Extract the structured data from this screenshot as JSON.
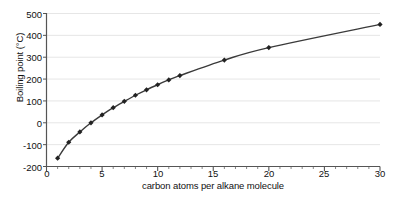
{
  "chart_data": {
    "type": "line",
    "title": "",
    "xlabel": "carbon atoms per alkane molecule",
    "ylabel": "Boiling point (°C)",
    "xlim": [
      0,
      30
    ],
    "ylim": [
      -200,
      500
    ],
    "xticks": [
      0,
      5,
      10,
      15,
      20,
      25,
      30
    ],
    "xtick_labels": [
      "0",
      "5",
      "10",
      "15",
      "20",
      "25",
      "30"
    ],
    "x_minor_tick_step": 1,
    "yticks": [
      -200,
      -100,
      0,
      100,
      200,
      300,
      400,
      500
    ],
    "ytick_labels": [
      "-200",
      "-100",
      "0",
      "100",
      "200",
      "300",
      "400",
      "500"
    ],
    "grid": "horizontal",
    "grid_color": "#e6e6e6",
    "legend": "none",
    "line_color": "#3a3a3a",
    "marker": "diamond",
    "marker_color": "#222222",
    "x": [
      1,
      2,
      3,
      4,
      5,
      6,
      7,
      8,
      9,
      10,
      11,
      12,
      16,
      20,
      30
    ],
    "values": [
      -162,
      -89,
      -42,
      0,
      36,
      69,
      98,
      126,
      151,
      174,
      196,
      216,
      287,
      344,
      450
    ],
    "series": [
      {
        "name": "boiling point",
        "x": [
          1,
          2,
          3,
          4,
          5,
          6,
          7,
          8,
          9,
          10,
          11,
          12,
          16,
          20,
          30
        ],
        "values": [
          -162,
          -89,
          -42,
          0,
          36,
          69,
          98,
          126,
          151,
          174,
          196,
          216,
          287,
          344,
          450
        ]
      }
    ]
  }
}
